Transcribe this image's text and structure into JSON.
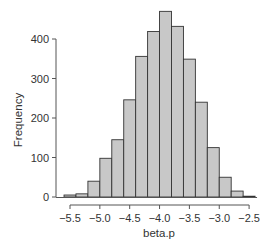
{
  "chart_data": {
    "type": "bar",
    "subtype": "histogram",
    "title": "",
    "xlabel": "beta.p",
    "ylabel": "Frequency",
    "bin_edges": [
      -5.6,
      -5.4,
      -5.2,
      -5.0,
      -4.8,
      -4.6,
      -4.4,
      -4.2,
      -4.0,
      -3.8,
      -3.6,
      -3.4,
      -3.2,
      -3.0,
      -2.8,
      -2.6,
      -2.4
    ],
    "values": [
      5,
      8,
      40,
      98,
      145,
      246,
      356,
      419,
      470,
      432,
      349,
      240,
      125,
      50,
      15,
      2
    ],
    "xlim": [
      -5.6,
      -2.4
    ],
    "ylim": [
      0,
      480
    ],
    "x_ticks": [
      -5.5,
      -5.0,
      -4.5,
      -4.0,
      -3.5,
      -3.0,
      -2.5
    ],
    "x_tick_labels": [
      "−5.5",
      "−5.0",
      "−4.5",
      "−4.0",
      "−3.5",
      "−3.0",
      "−2.5"
    ],
    "y_ticks": [
      0,
      100,
      200,
      300,
      400
    ],
    "y_tick_labels": [
      "0",
      "100",
      "200",
      "300",
      "400"
    ],
    "grid": false,
    "legend": null,
    "colors": {
      "bar_fill": "#c8c8c8",
      "bar_stroke": "#333333",
      "axis": "#555555"
    }
  }
}
